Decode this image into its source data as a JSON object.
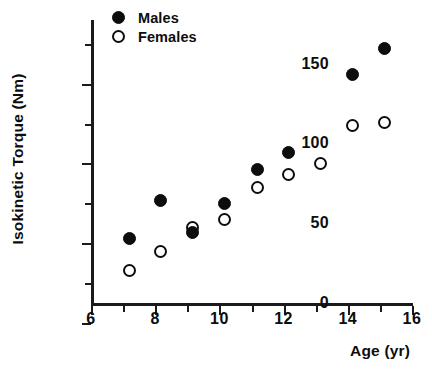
{
  "chart_data": {
    "type": "scatter",
    "title": "",
    "xlabel": "Age  (yr)",
    "ylabel": "Isokinetic  Torque  (Nm)",
    "xlim": [
      6,
      16
    ],
    "ylim": [
      0,
      178
    ],
    "grid": false,
    "legend_position": "top-left-inside",
    "x_ticks_major": [
      6,
      8,
      10,
      12,
      14,
      16
    ],
    "x_tick_labels": [
      "6",
      "8",
      "10",
      "12",
      "14",
      "16"
    ],
    "x_ticks_minor": [
      7,
      9,
      11,
      13,
      15
    ],
    "y_ticks_major": [
      0,
      50,
      100,
      150
    ],
    "y_tick_labels": [
      "0",
      "50",
      "100",
      "150"
    ],
    "y_ticks_minor": [
      25,
      75,
      125,
      175
    ],
    "series": [
      {
        "name": "Males",
        "marker": "filled-circle",
        "color": "#0d0d0d",
        "points": [
          {
            "x": 7.2,
            "y": 41
          },
          {
            "x": 8.15,
            "y": 65
          },
          {
            "x": 9.15,
            "y": 45
          },
          {
            "x": 10.15,
            "y": 63
          },
          {
            "x": 11.2,
            "y": 84
          },
          {
            "x": 12.15,
            "y": 95
          },
          {
            "x": 14.15,
            "y": 144
          },
          {
            "x": 15.15,
            "y": 160
          }
        ]
      },
      {
        "name": "Females",
        "marker": "open-circle",
        "color": "#0d0d0d",
        "points": [
          {
            "x": 7.2,
            "y": 21
          },
          {
            "x": 8.15,
            "y": 33
          },
          {
            "x": 9.15,
            "y": 48
          },
          {
            "x": 10.15,
            "y": 53
          },
          {
            "x": 11.2,
            "y": 73
          },
          {
            "x": 12.15,
            "y": 81
          },
          {
            "x": 13.15,
            "y": 88
          },
          {
            "x": 14.15,
            "y": 112
          },
          {
            "x": 15.15,
            "y": 114
          }
        ]
      }
    ]
  },
  "legend": {
    "entries": [
      {
        "label": "Males",
        "marker": "filled-circle"
      },
      {
        "label": "Females",
        "marker": "open-circle"
      }
    ]
  },
  "axes": {
    "x_title": "Age  (yr)",
    "y_title": "Isokinetic  Torque  (Nm)"
  }
}
